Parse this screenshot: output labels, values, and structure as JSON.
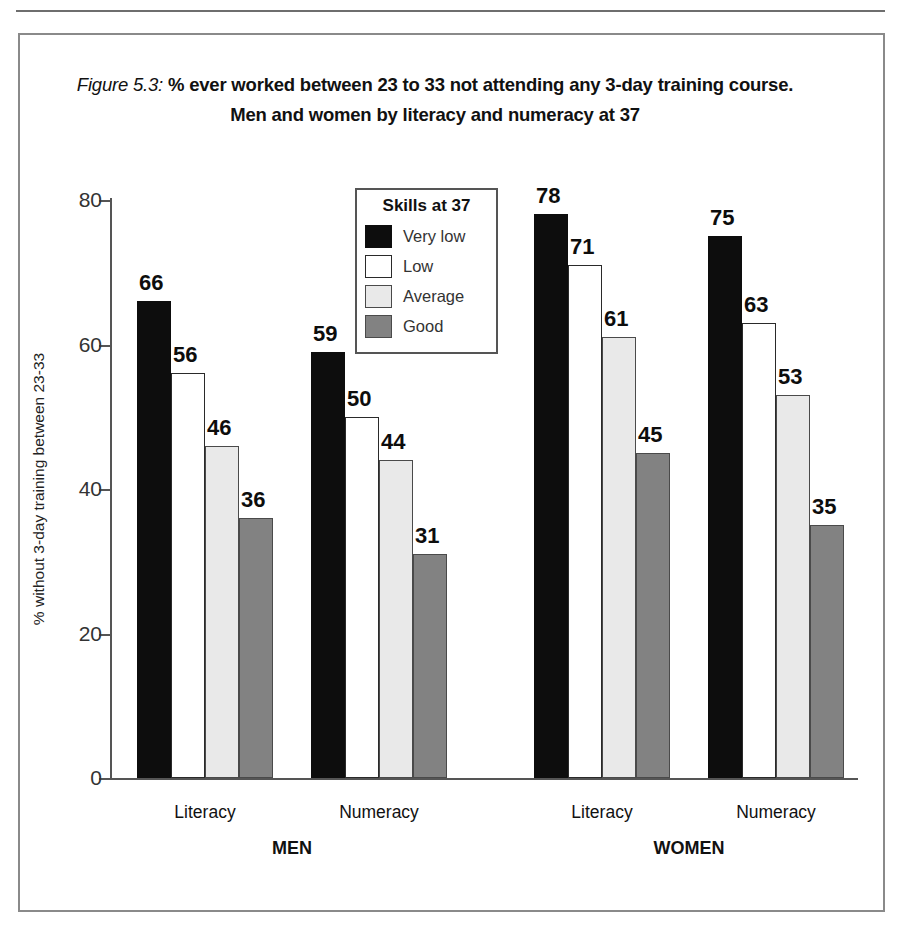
{
  "caption": {
    "figure_label": "Figure 5.3:",
    "line1": " % ever worked between 23 to 33 not attending any 3-day training course.",
    "line2": "Men and women by literacy and numeracy at 37"
  },
  "legend": {
    "title": "Skills at 37",
    "items": [
      {
        "label": "Very low",
        "color": "#0d0d0d",
        "key": "verylow"
      },
      {
        "label": "Low",
        "color": "#ffffff",
        "key": "low"
      },
      {
        "label": "Average",
        "color": "#e9e9e9",
        "key": "average"
      },
      {
        "label": "Good",
        "color": "#828282",
        "key": "good"
      }
    ]
  },
  "chart_data": {
    "type": "bar",
    "title": "Figure 5.3: % ever worked between 23 to 33 not attending any 3-day training course. Men and women by literacy and numeracy at 37",
    "xlabel": "",
    "ylabel": "% without 3-day training between 23-33",
    "ylim": [
      0,
      80
    ],
    "yticks": [
      0,
      20,
      40,
      60,
      80
    ],
    "ytick_labels": [
      "0",
      "20",
      "40",
      "60",
      "80"
    ],
    "grid": false,
    "legend_position": "inside-top-center",
    "legend_title": "Skills at 37",
    "categories": [
      "MEN / Literacy",
      "MEN / Numeracy",
      "WOMEN / Literacy",
      "WOMEN / Numeracy"
    ],
    "group_labels": [
      "MEN",
      "WOMEN"
    ],
    "subgroup_labels": [
      "Literacy",
      "Numeracy",
      "Literacy",
      "Numeracy"
    ],
    "series": [
      {
        "name": "Very low",
        "color": "#0d0d0d",
        "values": [
          66,
          59,
          78,
          75
        ]
      },
      {
        "name": "Low",
        "color": "#ffffff",
        "values": [
          56,
          50,
          71,
          63
        ]
      },
      {
        "name": "Average",
        "color": "#e9e9e9",
        "values": [
          46,
          44,
          61,
          53
        ]
      },
      {
        "name": "Good",
        "color": "#828282",
        "values": [
          36,
          31,
          45,
          35
        ]
      }
    ]
  },
  "axis": {
    "y_title": "% without 3-day training between 23-33"
  }
}
